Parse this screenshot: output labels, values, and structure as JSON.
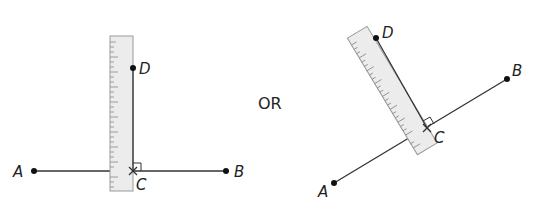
{
  "figure": {
    "or_label": "OR",
    "left": {
      "labels": {
        "A": "A",
        "B": "B",
        "C": "C",
        "D": "D"
      }
    },
    "right": {
      "labels": {
        "A": "A",
        "B": "B",
        "C": "C",
        "D": "D"
      }
    },
    "colors": {
      "line": "#333333",
      "ruler_fill": "#ececec",
      "ruler_stroke": "#9a9a9a"
    }
  }
}
